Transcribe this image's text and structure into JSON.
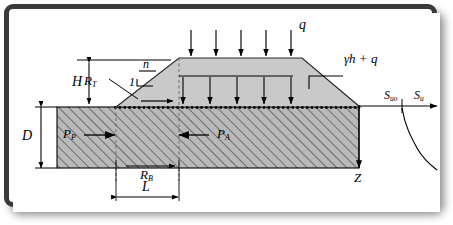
{
  "diagram": {
    "type": "geotechnical-cross-section",
    "colors": {
      "frame": "#3a3a3a",
      "background": "#ffffff",
      "embankment_fill": "#c8c8c8",
      "foundation_fill": "#b4b4b4",
      "line": "#000000"
    }
  },
  "labels": {
    "surcharge": {
      "text": "q",
      "desc": "surcharge load on embankment crest"
    },
    "gamma_h_q": {
      "text": "γh + q",
      "desc": "vertical stress gamma-h plus q"
    },
    "height": {
      "text": "H",
      "desc": "embankment height"
    },
    "depth": {
      "text": "D",
      "desc": "foundation layer depth"
    },
    "length": {
      "text": "L",
      "desc": "block length"
    },
    "slope_rise": {
      "text": "1",
      "desc": "slope vertical component"
    },
    "slope_run": {
      "text": "n",
      "desc": "slope horizontal component"
    },
    "resist_top": {
      "base": "R",
      "sub": "T",
      "desc": "shear resistance along top of block"
    },
    "resist_base": {
      "base": "R",
      "sub": "B",
      "desc": "shear resistance along base of block"
    },
    "passive": {
      "base": "P",
      "sub": "P",
      "desc": "passive earth force"
    },
    "active": {
      "base": "P",
      "sub": "A",
      "desc": "active earth force"
    },
    "depth_axis": {
      "text": "Z",
      "desc": "depth coordinate axis"
    },
    "su_surface": {
      "base": "S",
      "sub": "uo",
      "desc": "undrained shear strength at surface"
    },
    "su": {
      "base": "S",
      "sub": "u",
      "desc": "undrained shear strength"
    }
  },
  "geometry": {
    "arrow_count_surcharge": 5,
    "arrow_count_internal": 5,
    "embankment_crest_y": 45,
    "ground_level_y": 94,
    "foundation_base_y": 155
  }
}
